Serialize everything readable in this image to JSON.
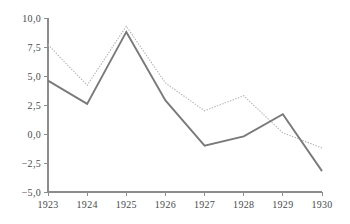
{
  "chart_data": {
    "type": "line",
    "title": "",
    "subtitle": "",
    "xlabel": "",
    "ylabel": "",
    "categories": [
      "1923",
      "1924",
      "1925",
      "1926",
      "1927",
      "1928",
      "1929",
      "1930"
    ],
    "x": [
      1923,
      1924,
      1925,
      1926,
      1927,
      1928,
      1929,
      1930
    ],
    "series": [
      {
        "name": "dotted-series",
        "style": "dotted",
        "color": "#b3b3b3",
        "values": [
          7.7,
          4.2,
          9.3,
          4.4,
          2.0,
          3.3,
          0.1,
          -1.2
        ]
      },
      {
        "name": "solid-series",
        "style": "solid",
        "color": "#7a7a7a",
        "values": [
          4.6,
          2.6,
          8.8,
          2.9,
          -1.0,
          -0.2,
          1.7,
          -3.2
        ]
      }
    ],
    "ylim": [
      -5.0,
      10.0
    ],
    "xlim": [
      1923,
      1930
    ],
    "yticks": [
      -5.0,
      -2.5,
      0.0,
      2.5,
      5.0,
      7.5,
      10.0
    ],
    "ytick_labels": [
      "−5,0",
      "−2,5",
      "0,0",
      "2,5",
      "5,0",
      "7,5",
      "10,0"
    ],
    "xtick_labels": [
      "1923",
      "1924",
      "1925",
      "1926",
      "1927",
      "1928",
      "1929",
      "1930"
    ],
    "grid": false,
    "legend": null,
    "legend_position": "none",
    "annotations": [],
    "decimal_separator": ",",
    "axis_color": "#8c8c8c",
    "text_color": "#4a4a4a",
    "background_color": "#ffffff"
  },
  "layout": {
    "plot_left": 48,
    "plot_right": 322,
    "plot_top": 18,
    "plot_bottom": 192
  }
}
